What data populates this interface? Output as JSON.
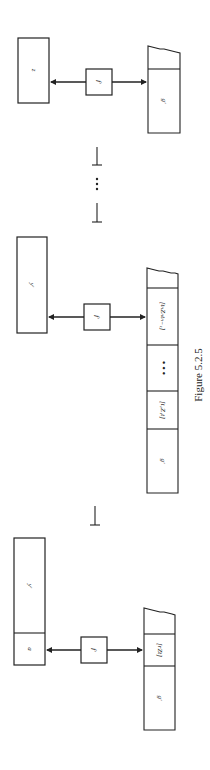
{
  "figure": {
    "caption": "Figure 5.2.5",
    "orientation": "rotated 90° clockwise (landscape figure on portrait page)",
    "turnstile": "⊢",
    "ellipsis": "• • •"
  },
  "configurations": [
    {
      "id": "config-1",
      "left_box": {
        "cells": [
          "a",
          "y'"
        ]
      },
      "control": {
        "label": "f'"
      },
      "tape": {
        "cells": [
          "g'",
          "[rZt]"
        ],
        "torn_end": true
      }
    },
    {
      "id": "config-2",
      "left_box": {
        "cells": [
          "y'"
        ]
      },
      "control": {
        "label": "f'"
      },
      "tape": {
        "cells": [
          "g'",
          "[t₁Z₁t]",
          "• • •",
          "[tₙZₙtₙ₋₁]"
        ],
        "torn_end": true
      }
    },
    {
      "id": "config-3",
      "left_box": {
        "cells": [
          "z"
        ]
      },
      "control": {
        "label": "f'"
      },
      "tape": {
        "cells": [
          "g'"
        ],
        "torn_end": true
      }
    }
  ],
  "separators": [
    "⊢",
    "• • •",
    "⊢",
    "⊢"
  ]
}
